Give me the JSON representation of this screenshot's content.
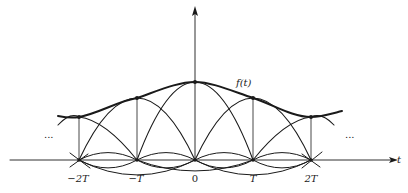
{
  "diagram": {
    "function_label": "f(t)",
    "axis_label_t": "t",
    "ellipsis_left": "...",
    "ellipsis_right": "...",
    "tick_labels": [
      "−2T",
      "−T",
      "0",
      "T",
      "2T"
    ],
    "colors": {
      "ink": "#1a1a1a",
      "background": "#ffffff"
    }
  }
}
